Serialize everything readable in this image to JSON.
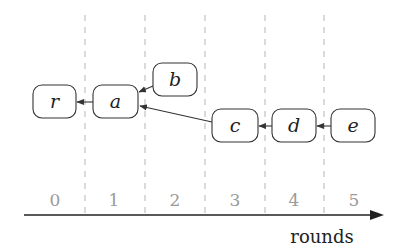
{
  "diagram": {
    "nodes": [
      {
        "id": "r",
        "label": "r",
        "round": 0
      },
      {
        "id": "a",
        "label": "a",
        "round": 1
      },
      {
        "id": "b",
        "label": "b",
        "round": 2
      },
      {
        "id": "c",
        "label": "c",
        "round": 3
      },
      {
        "id": "d",
        "label": "d",
        "round": 4
      },
      {
        "id": "e",
        "label": "e",
        "round": 5
      }
    ],
    "edges": [
      {
        "from": "a",
        "to": "r"
      },
      {
        "from": "b",
        "to": "a"
      },
      {
        "from": "c",
        "to": "a"
      },
      {
        "from": "d",
        "to": "c"
      },
      {
        "from": "e",
        "to": "d"
      }
    ],
    "axis": {
      "label": "rounds",
      "ticks": [
        "0",
        "1",
        "2",
        "3",
        "4",
        "5"
      ]
    },
    "colors": {
      "node_stroke": "#333333",
      "edge": "#333333",
      "grid": "#b0b0b0",
      "tick_text": "#9a9a9a"
    }
  }
}
